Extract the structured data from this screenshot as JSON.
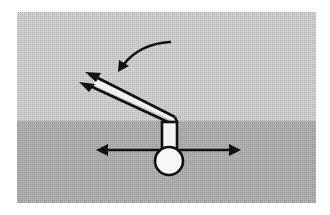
{
  "diagram": {
    "colors": {
      "background": "#ffffff",
      "panel_upper": "#c8c8c8",
      "panel_lower": "#a9a9a9",
      "stroke": "#111111",
      "fill_white": "#f4f4f4"
    },
    "elements": [
      {
        "name": "rotation-arrow",
        "meaning": "rotate lever downward"
      },
      {
        "name": "lever-handle",
        "meaning": "double-line lever with two arrowheads"
      },
      {
        "name": "lever-stem",
        "meaning": "vertical stem"
      },
      {
        "name": "horizontal-double-arrow",
        "meaning": "move left/right"
      },
      {
        "name": "pivot-circle",
        "meaning": "pivot point"
      }
    ]
  }
}
